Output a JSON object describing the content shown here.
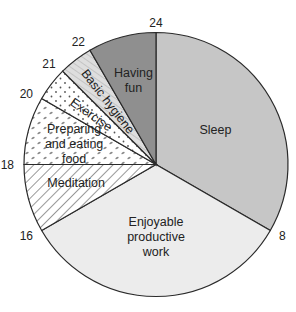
{
  "chart_data": {
    "type": "pie",
    "title": "",
    "unit": "hours",
    "total": 24,
    "start_hour": 0,
    "direction": "clockwise",
    "slices": [
      {
        "label": "Sleep",
        "start": 0,
        "end": 8,
        "value": 8,
        "fill": "#c6c6c6",
        "pattern": "solid"
      },
      {
        "label": "Enjoyable productive work",
        "label_lines": [
          "Enjoyable",
          "productive",
          "work"
        ],
        "start": 8,
        "end": 16,
        "value": 8,
        "fill": "#ececec",
        "pattern": "solid"
      },
      {
        "label": "Meditation",
        "start": 16,
        "end": 18,
        "value": 2,
        "fill": "#ffffff",
        "pattern": "diagonal-lines"
      },
      {
        "label": "Preparing and eating food",
        "label_lines": [
          "Preparing",
          "and eating",
          "food"
        ],
        "start": 18,
        "end": 20,
        "value": 2,
        "fill": "#ffffff",
        "pattern": "dashes"
      },
      {
        "label": "Exercise",
        "start": 20,
        "end": 21,
        "value": 1,
        "fill": "#ffffff",
        "pattern": "dots"
      },
      {
        "label": "Basic hygiene",
        "start": 21,
        "end": 22,
        "value": 1,
        "fill": "#dcdcdc",
        "pattern": "diagonal-lines-light"
      },
      {
        "label": "Having fun",
        "label_lines": [
          "Having",
          "fun"
        ],
        "start": 22,
        "end": 24,
        "value": 2,
        "fill": "#8f8f8f",
        "pattern": "solid"
      }
    ],
    "tick_labels": [
      "24",
      "8",
      "16",
      "18",
      "20",
      "21",
      "22"
    ],
    "tick_values": [
      24,
      8,
      16,
      18,
      20,
      21,
      22
    ],
    "legend": "none",
    "grid": false
  }
}
